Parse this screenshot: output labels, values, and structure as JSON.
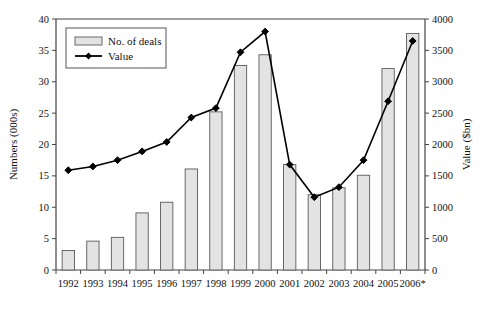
{
  "chart_data": {
    "type": "bar",
    "title": "",
    "subtitle": "",
    "categories": [
      "1992",
      "1993",
      "1994",
      "1995",
      "1996",
      "1997",
      "1998",
      "1999",
      "2000",
      "2001",
      "2002",
      "2003",
      "2004",
      "2005",
      "2006*"
    ],
    "xlabel": "",
    "ylabel": "Numbers (000s)",
    "y2label": "Value ($bn)",
    "ylim": [
      0,
      40
    ],
    "y2lim": [
      0,
      4000
    ],
    "yticks": [
      0,
      5,
      10,
      15,
      20,
      25,
      30,
      35,
      40
    ],
    "ytick_labels": [
      "0",
      "5",
      "10",
      "15",
      "20",
      "25",
      "30",
      "35",
      "40"
    ],
    "y2ticks": [
      0,
      500,
      1000,
      1500,
      2000,
      2500,
      3000,
      3500,
      4000
    ],
    "y2tick_labels": [
      "0",
      "500",
      "1000",
      "1500",
      "2000",
      "2500",
      "3000",
      "3500",
      "4000"
    ],
    "grid": false,
    "legend_position": "upper left",
    "series": [
      {
        "name": "No. of deals",
        "kind": "bar",
        "axis": "left",
        "unit": "000s",
        "color": "#e3e3e3",
        "edge_color": "#5a5a5a",
        "values": [
          3.1,
          4.6,
          5.2,
          9.1,
          10.8,
          16.1,
          25.2,
          32.6,
          34.3,
          16.8,
          12.0,
          13.1,
          15.1,
          32.1,
          37.7
        ]
      },
      {
        "name": "Value",
        "kind": "line",
        "axis": "right",
        "unit": "$bn",
        "color": "#000000",
        "marker": "diamond",
        "values": [
          1590,
          1650,
          1750,
          1890,
          2040,
          2430,
          2580,
          3470,
          3800,
          1680,
          1160,
          1320,
          1750,
          2690,
          3650
        ]
      }
    ],
    "annotations": [
      "2006*"
    ]
  },
  "axes": {
    "left_title": "Numbers (000s)",
    "right_title": "Value ($bn)"
  },
  "legend": {
    "items": [
      {
        "label": "No. of deals",
        "swatch": "bar-swatch"
      },
      {
        "label": "Value",
        "swatch": "line-marker-swatch"
      }
    ]
  }
}
